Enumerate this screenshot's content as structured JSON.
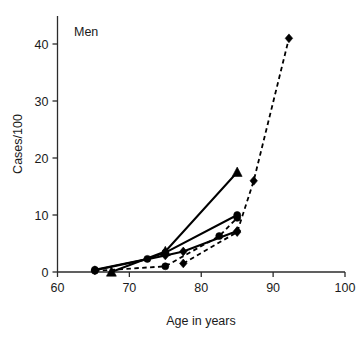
{
  "chart_data": {
    "type": "line",
    "title": "Men",
    "xlabel": "Age in years",
    "ylabel": "Cases/100",
    "xlim": [
      60,
      100
    ],
    "ylim": [
      0,
      44
    ],
    "xticks": [
      60,
      70,
      80,
      90,
      100
    ],
    "yticks": [
      0,
      10,
      20,
      30,
      40
    ],
    "xtick_labels": [
      "60",
      "70",
      "80",
      "90",
      "100"
    ],
    "ytick_labels": [
      "0",
      "10",
      "20",
      "30",
      "40"
    ],
    "grid": false,
    "legend": "none",
    "series": [
      {
        "name": "series-solid-triangle",
        "style": "solid",
        "marker": "triangle",
        "x": [
          67.5,
          75.0,
          85.0
        ],
        "y": [
          0.0,
          3.6,
          17.5
        ]
      },
      {
        "name": "series-solid-circle",
        "style": "solid",
        "marker": "circle",
        "x": [
          65.2,
          72.5,
          75.0,
          85.0
        ],
        "y": [
          0.4,
          2.3,
          3.4,
          10.0
        ]
      },
      {
        "name": "series-solid-diamond",
        "style": "solid",
        "marker": "diamond",
        "x": [
          65.2,
          75.0,
          77.5,
          85.0
        ],
        "y": [
          0.3,
          2.9,
          3.6,
          7.2
        ]
      },
      {
        "name": "series-dashed-circle",
        "style": "dashed",
        "marker": "circle",
        "x": [
          65.2,
          75.0,
          82.5,
          85.0
        ],
        "y": [
          0.2,
          1.0,
          6.3,
          9.5
        ]
      },
      {
        "name": "series-dashed-diamond",
        "style": "dashed",
        "marker": "diamond",
        "x": [
          77.5,
          85.0,
          87.3,
          92.2
        ],
        "y": [
          1.5,
          7.0,
          16.0,
          41.0
        ]
      }
    ]
  },
  "axis": {
    "x_title": "Age in years",
    "y_title": "Cases/100"
  },
  "panel": {
    "label": "Men"
  }
}
